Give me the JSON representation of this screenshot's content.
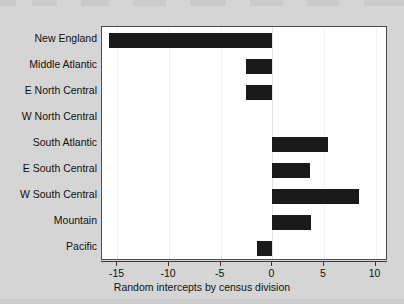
{
  "chart_data": {
    "type": "bar",
    "orientation": "horizontal",
    "title": "",
    "subtitle": "",
    "xlabel": "Random intercepts by census division",
    "ylabel": "",
    "categories": [
      "New England",
      "Middle Atlantic",
      "E North Central",
      "W North Central",
      "South Atlantic",
      "E South Central",
      "W South Central",
      "Mountain",
      "Pacific"
    ],
    "values": [
      -15.8,
      -2.6,
      -2.6,
      0.0,
      5.4,
      3.6,
      8.4,
      3.7,
      -1.5
    ],
    "xlim": [
      -16.5,
      11.2
    ],
    "xticks": [
      -15,
      -10,
      -5,
      0,
      5,
      10
    ],
    "xtick_labels": [
      "-15",
      "-10",
      "-5",
      "0",
      "5",
      "10"
    ],
    "grid": true,
    "grid_axis": "x",
    "legend": false,
    "bar_color": "#1a1a1a",
    "panel_background": "#ffffff",
    "figure_background": "#d5d5d5",
    "axis_color": "#3a3a3a",
    "gridline_color": "#f2f2f2"
  }
}
